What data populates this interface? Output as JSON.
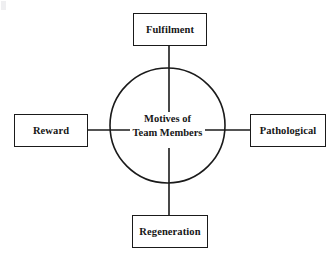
{
  "diagram": {
    "title": "Motives of Team Members",
    "center": {
      "line1": "Motives of",
      "line2": "Team Members",
      "shape": "circle"
    },
    "nodes": [
      {
        "id": "top",
        "label": "Fulfilment",
        "position": "top"
      },
      {
        "id": "left",
        "label": "Reward",
        "position": "left"
      },
      {
        "id": "right",
        "label": "Pathological",
        "position": "right"
      },
      {
        "id": "bottom",
        "label": "Regeneration",
        "position": "bottom"
      }
    ],
    "connectors": [
      {
        "from": "center",
        "to": "top",
        "style": "line"
      },
      {
        "from": "center",
        "to": "left",
        "style": "line"
      },
      {
        "from": "center",
        "to": "right",
        "style": "line"
      },
      {
        "from": "center",
        "to": "bottom",
        "style": "line"
      }
    ],
    "colors": {
      "stroke": "#1a1a1a",
      "background": "#ffffff",
      "text": "#161616"
    }
  }
}
